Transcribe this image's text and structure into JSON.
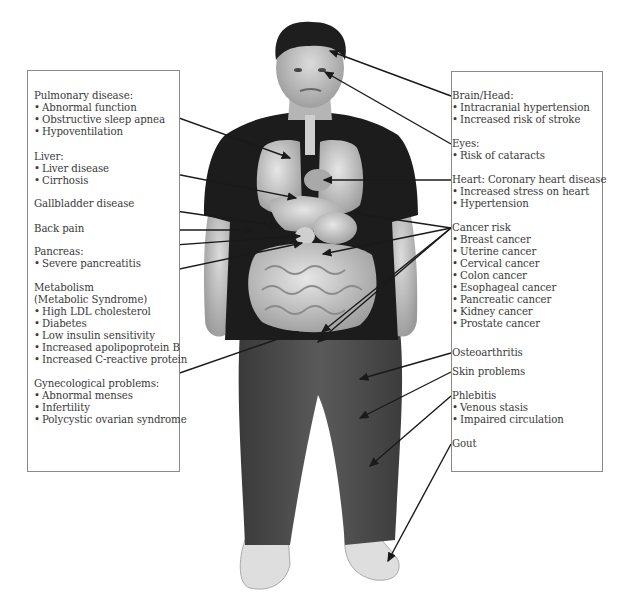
{
  "left_panel": {
    "groups": [
      {
        "heading": "Pulmonary disease:",
        "items": [
          "Abnormal function",
          "Obstructive sleep apnea",
          "Hypoventilation"
        ]
      },
      {
        "heading": "Liver:",
        "items": [
          "Liver disease",
          "Cirrhosis"
        ]
      },
      {
        "heading": "Gallbladder disease",
        "items": []
      },
      {
        "heading": "Back pain",
        "items": []
      },
      {
        "heading": "Pancreas:",
        "items": [
          "Severe pancreatitis"
        ]
      },
      {
        "heading": "Metabolism",
        "subheading": "(Metabolic Syndrome)",
        "items": [
          "High LDL cholesterol",
          "Diabetes",
          "Low insulin sensitivity",
          "Increased apolipoprotein B",
          "Increased C-reactive protein"
        ]
      },
      {
        "heading": "Gynecological problems:",
        "items": [
          "Abnormal menses",
          "Infertility",
          "Polycystic ovarian syndrome"
        ]
      }
    ]
  },
  "right_panel": {
    "groups": [
      {
        "heading": "Brain/Head:",
        "items": [
          "Intracranial hypertension",
          "Increased risk of stroke"
        ]
      },
      {
        "heading": "Eyes:",
        "items": [
          "Risk of cataracts"
        ]
      },
      {
        "heading": "Heart: Coronary heart disease",
        "items": [
          "Increased stress on heart",
          "Hypertension"
        ]
      },
      {
        "heading": "Cancer risk",
        "items": [
          "Breast cancer",
          "Uterine cancer",
          "Cervical cancer",
          "Colon cancer",
          "Esophageal cancer",
          "Pancreatic cancer",
          "Kidney cancer",
          "Prostate cancer"
        ]
      },
      {
        "heading": "Osteoarthritis",
        "items": []
      },
      {
        "heading": "Skin problems",
        "items": []
      },
      {
        "heading": "Phlebitis",
        "items": [
          "Venous stasis",
          "Impaired circulation"
        ]
      },
      {
        "heading": "Gout",
        "items": []
      }
    ]
  },
  "colors": {
    "box_border": "#8a8a8a",
    "text": "#3a3a3a",
    "arrow": "#1a1a1a",
    "shirt": "#1c1c1c",
    "pants": "#4a4a4a",
    "skin": "#cfcfcf",
    "organs": "#bdbdbd"
  }
}
